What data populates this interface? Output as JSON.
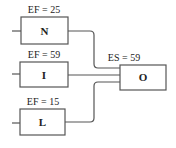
{
  "diagram": {
    "type": "network-activity",
    "nodes": [
      {
        "id": "N",
        "label": "N",
        "annotation": "EF = 25"
      },
      {
        "id": "I",
        "label": "I",
        "annotation": "EF = 59"
      },
      {
        "id": "L",
        "label": "L",
        "annotation": "EF = 15"
      },
      {
        "id": "O",
        "label": "O",
        "annotation": "ES = 59"
      }
    ],
    "edges": [
      {
        "from": "N",
        "to": "O"
      },
      {
        "from": "I",
        "to": "O"
      },
      {
        "from": "L",
        "to": "O"
      }
    ]
  }
}
